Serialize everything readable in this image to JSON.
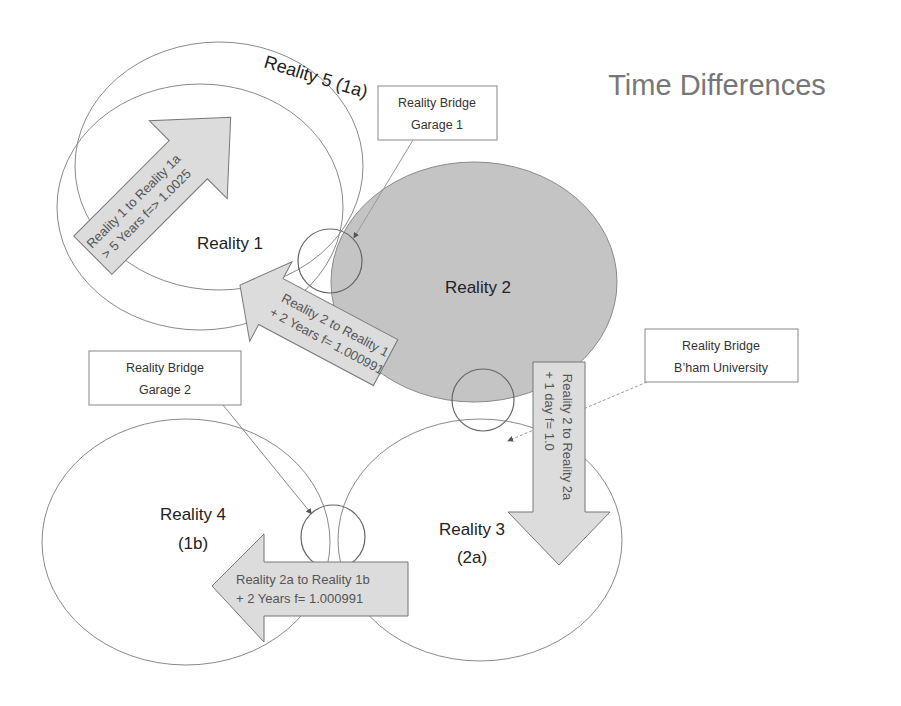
{
  "title": "Time Differences",
  "colors": {
    "background": "#ffffff",
    "outline": "#8a8a8a",
    "reality2_fill": "#c4c4c4",
    "arrow_fill": "#dcdcdc",
    "arrow_stroke": "#777777",
    "title_color": "#777777"
  },
  "realities": [
    {
      "id": "reality-5",
      "label": "Reality 5 (1a)"
    },
    {
      "id": "reality-1",
      "label": "Reality 1"
    },
    {
      "id": "reality-2",
      "label": "Reality 2"
    },
    {
      "id": "reality-3",
      "label_line1": "Reality 3",
      "label_line2": "(2a)"
    },
    {
      "id": "reality-4",
      "label_line1": "Reality 4",
      "label_line2": "(1b)"
    }
  ],
  "bridges": [
    {
      "id": "garage-1",
      "line1": "Reality Bridge",
      "line2": "Garage 1"
    },
    {
      "id": "garage-2",
      "line1": "Reality Bridge",
      "line2": "Garage 2"
    },
    {
      "id": "bham-university",
      "line1": "Reality Bridge",
      "line2": "B’ham University"
    }
  ],
  "transitions": [
    {
      "id": "r1-to-r1a",
      "line1": "Reality 1 to Reality 1a",
      "line2": "> 5 Years  f=> 1.0025"
    },
    {
      "id": "r2-to-r1",
      "line1": "Reality 2 to Reality 1",
      "line2": "+ 2 Years  f= 1.000991"
    },
    {
      "id": "r2-to-r2a",
      "line1": "Reality 2 to Reality 2a",
      "line2": "+ 1 day f= 1.0"
    },
    {
      "id": "r2a-to-r1b",
      "line1": "Reality 2a to Reality 1b",
      "line2": "+ 2 Years  f= 1.000991"
    }
  ]
}
